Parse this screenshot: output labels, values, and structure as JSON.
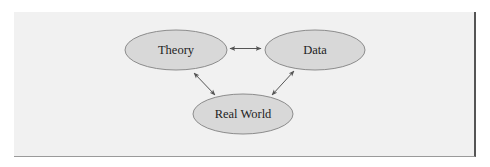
{
  "diagram": {
    "nodes": [
      {
        "id": "theory",
        "label": "Theory",
        "cx": 176,
        "cy": 50,
        "rx": 51,
        "ry": 20
      },
      {
        "id": "data",
        "label": "Data",
        "cx": 315,
        "cy": 50,
        "rx": 50,
        "ry": 20
      },
      {
        "id": "real-world",
        "label": "Real World",
        "cx": 243,
        "cy": 114,
        "rx": 50,
        "ry": 20
      }
    ],
    "edges": [
      {
        "from": "theory",
        "to": "data",
        "type": "bidirectional"
      },
      {
        "from": "theory",
        "to": "real-world",
        "type": "bidirectional"
      },
      {
        "from": "data",
        "to": "real-world",
        "type": "bidirectional"
      }
    ],
    "colors": {
      "panel_fill": "#f1f1f1",
      "node_fill": "#d8d8d8",
      "node_stroke": "#8c8c8c",
      "arrow": "#555555",
      "text": "#1e1e1e"
    }
  }
}
